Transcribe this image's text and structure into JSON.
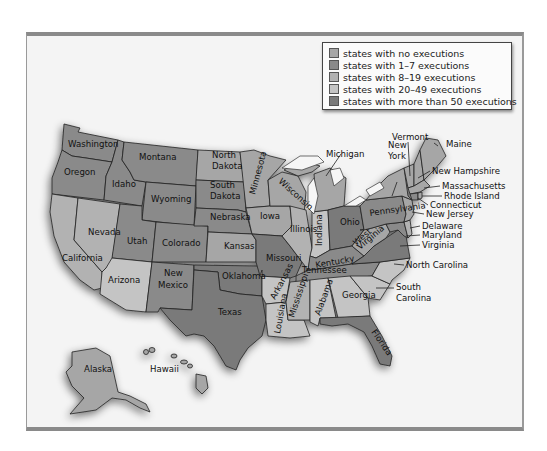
{
  "legend": {
    "items": [
      {
        "label": "states with no executions",
        "color": "#a6a6a6"
      },
      {
        "label": "states with 1–7 executions",
        "color": "#8a8a8a"
      },
      {
        "label": "states with 8–19 executions",
        "color": "#b2b2b2"
      },
      {
        "label": "states with 20–49 executions",
        "color": "#c4c4c4"
      },
      {
        "label": "states with more than 50 executions",
        "color": "#7a7a7a"
      }
    ]
  },
  "colors": {
    "frame_bg": "#f4f4f4",
    "frame_border": "#8a8a8a",
    "lakes": "#f6f6f6",
    "shadow": "#bdbdbd"
  },
  "states": {
    "washington": {
      "label": "Washington",
      "category": 1
    },
    "oregon": {
      "label": "Oregon",
      "category": 1
    },
    "idaho": {
      "label": "Idaho",
      "category": 1
    },
    "montana": {
      "label": "Montana",
      "category": 1
    },
    "wyoming": {
      "label": "Wyoming",
      "category": 1
    },
    "north_dakota": {
      "label_1": "North",
      "label_2": "Dakota",
      "category": 0
    },
    "south_dakota": {
      "label_1": "South",
      "label_2": "Dakota",
      "category": 1
    },
    "nebraska": {
      "label": "Nebraska",
      "category": 1
    },
    "minnesota": {
      "label": "Minnesota",
      "category": 0
    },
    "wisconsin": {
      "label": "Wisconsin",
      "category": 0
    },
    "michigan": {
      "label": "Michigan",
      "category": 0
    },
    "iowa": {
      "label": "Iowa",
      "category": 0
    },
    "illinois": {
      "label": "Illinois",
      "category": 2
    },
    "indiana": {
      "label": "Indiana",
      "category": 3
    },
    "ohio": {
      "label": "Ohio",
      "category": 4
    },
    "nevada": {
      "label": "Nevada",
      "category": 2
    },
    "california": {
      "label": "California",
      "category": 2
    },
    "utah": {
      "label": "Utah",
      "category": 1
    },
    "colorado": {
      "label": "Colorado",
      "category": 1
    },
    "kansas": {
      "label": "Kansas",
      "category": 0
    },
    "missouri": {
      "label": "Missouri",
      "category": 4
    },
    "arizona": {
      "label": "Arizona",
      "category": 3
    },
    "new_mexico": {
      "label_1": "New",
      "label_2": "Mexico",
      "category": 1
    },
    "oklahoma": {
      "label": "Oklahoma",
      "category": 4
    },
    "texas": {
      "label": "Texas",
      "category": 4
    },
    "arkansas": {
      "label": "Arkansas",
      "category": 3
    },
    "louisiana": {
      "label": "Louisiana",
      "category": 3
    },
    "mississippi": {
      "label": "Mississippi",
      "category": 2
    },
    "alabama": {
      "label": "Alabama",
      "category": 3
    },
    "georgia": {
      "label": "Georgia",
      "category": 3
    },
    "florida": {
      "label": "Florida",
      "category": 4
    },
    "tennessee": {
      "label": "Tennessee",
      "category": 1
    },
    "kentucky": {
      "label": "Kentucky",
      "category": 1
    },
    "west_virginia": {
      "label_1": "West",
      "label_2": "Virginia",
      "category": 0
    },
    "virginia": {
      "label": "Virginia",
      "category": 4
    },
    "north_carolina": {
      "label": "North Carolina",
      "category": 3
    },
    "south_carolina": {
      "label_1": "South",
      "label_2": "Carolina",
      "category": 3
    },
    "pennsylvania": {
      "label": "Pennsylvania",
      "category": 1
    },
    "new_york": {
      "label_1": "New",
      "label_2": "York",
      "category": 0
    },
    "vermont": {
      "label": "Vermont",
      "category": 0
    },
    "maine": {
      "label": "Maine",
      "category": 0
    },
    "new_hampshire": {
      "label": "New Hampshire",
      "category": 0
    },
    "massachusetts": {
      "label": "Massachusetts",
      "category": 0
    },
    "rhode_island": {
      "label": "Rhode Island",
      "category": 0
    },
    "connecticut": {
      "label": "Connecticut",
      "category": 1
    },
    "new_jersey": {
      "label": "New Jersey",
      "category": 0
    },
    "delaware": {
      "label": "Delaware",
      "category": 2
    },
    "maryland": {
      "label": "Maryland",
      "category": 1
    },
    "alaska": {
      "label": "Alaska",
      "category": 0
    },
    "hawaii": {
      "label": "Hawaii",
      "category": 0
    }
  }
}
